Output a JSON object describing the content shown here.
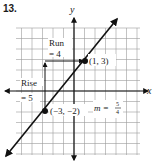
{
  "problem_number": "13.",
  "chart_data": {
    "type": "line",
    "title": "",
    "xlabel": "x",
    "ylabel": "y",
    "xlim": [
      -5.5,
      6.3
    ],
    "ylim": [
      -6,
      6
    ],
    "grid": true,
    "points": [
      {
        "x": 1,
        "y": 3,
        "label": "(1, 3)"
      },
      {
        "x": -3,
        "y": -2,
        "label": "(−3, −2)"
      }
    ],
    "line": {
      "slope": 1.25,
      "through": [
        [
          -3,
          -2
        ],
        [
          1,
          3
        ]
      ]
    },
    "annotations": {
      "run_label": "Run",
      "run_value": "= 4",
      "rise_label": "Rise",
      "rise_value": "= 5",
      "slope_label": "m =",
      "slope_numerator": "5",
      "slope_denominator": "4"
    }
  },
  "colors": {
    "line": "#111111",
    "grid": "#9a9a9a",
    "axis": "#111111",
    "background": "#ffffff"
  }
}
